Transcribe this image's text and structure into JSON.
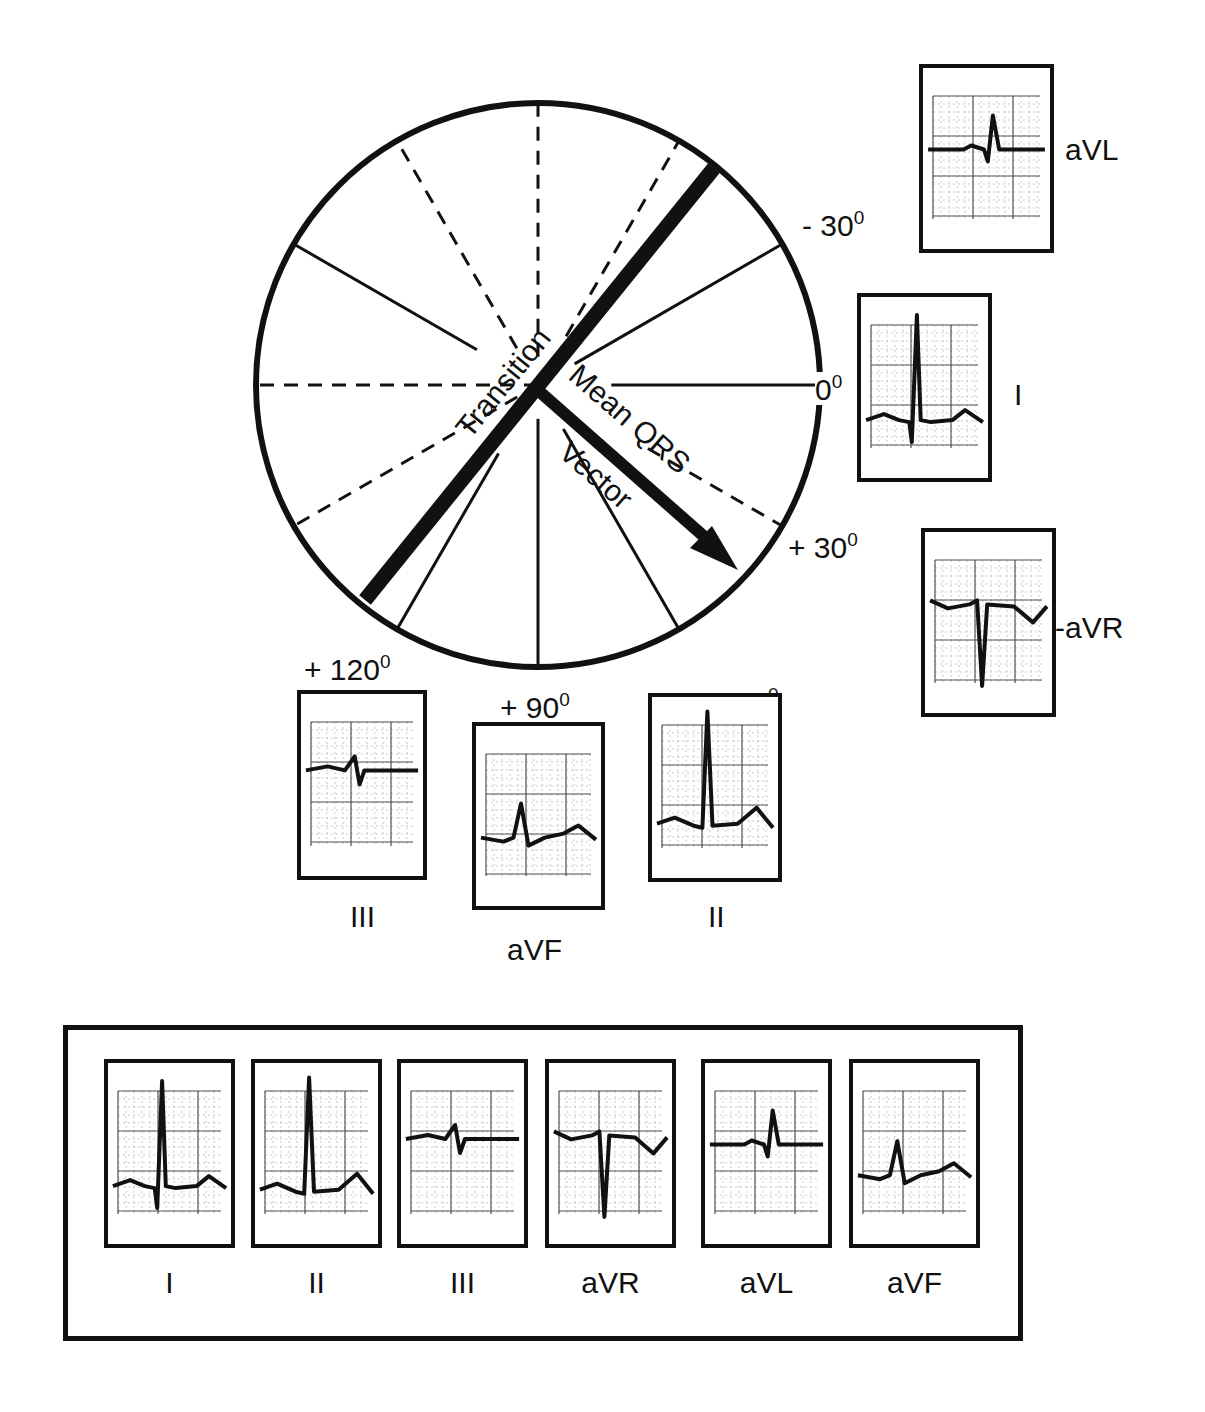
{
  "diagram": {
    "circle": {
      "center": [
        538,
        385
      ],
      "radius": 282,
      "axes": [
        {
          "lead": "I",
          "positive_deg": 0,
          "negative_deg": 180
        },
        {
          "lead": "II",
          "positive_deg": 60,
          "negative_deg": -120
        },
        {
          "lead": "III",
          "positive_deg": 120,
          "negative_deg": -60
        },
        {
          "lead": "aVR",
          "positive_deg": -150,
          "negative_deg": 30
        },
        {
          "lead": "aVL",
          "positive_deg": -30,
          "negative_deg": 150
        },
        {
          "lead": "aVF",
          "positive_deg": 90,
          "negative_deg": -90
        }
      ]
    },
    "labels": {
      "transition": "Transition",
      "mean_qrs": "Mean QRS",
      "vector": "Vector"
    },
    "mean_qrs_vector_deg": 40,
    "transition_deg": -50,
    "angle_labels": [
      {
        "id": "minus30",
        "sign": "- ",
        "value": "30",
        "unit": "0"
      },
      {
        "id": "zero",
        "sign": "",
        "value": "0",
        "unit": "0"
      },
      {
        "id": "plus30",
        "sign": "+ ",
        "value": "30",
        "unit": "0"
      },
      {
        "id": "plus60",
        "sign": "+  ",
        "value": "60",
        "unit": "0"
      },
      {
        "id": "plus90",
        "sign": "+ ",
        "value": "90",
        "unit": "0"
      },
      {
        "id": "plus120",
        "sign": "+ ",
        "value": "120",
        "unit": "0"
      }
    ],
    "axis_strips": [
      {
        "lead": "aVL",
        "label": "aVL",
        "type": "avl"
      },
      {
        "lead": "I",
        "label": "I",
        "type": "i"
      },
      {
        "lead": "-aVR",
        "label": "-aVR",
        "type": "avr"
      },
      {
        "lead": "III",
        "label": "III",
        "type": "iii"
      },
      {
        "lead": "aVF",
        "label": "aVF",
        "type": "avf"
      },
      {
        "lead": "II",
        "label": "II",
        "type": "ii"
      }
    ],
    "limb_lead_panel": {
      "strips": [
        {
          "label": "I",
          "type": "i"
        },
        {
          "label": "II",
          "type": "ii"
        },
        {
          "label": "III",
          "type": "iii"
        },
        {
          "label": "aVR",
          "type": "avr"
        },
        {
          "label": "aVL",
          "type": "avl"
        },
        {
          "label": "aVF",
          "type": "avf"
        }
      ]
    }
  }
}
